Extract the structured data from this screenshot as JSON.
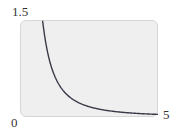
{
  "chart_data": {
    "type": "line",
    "title": "",
    "xlabel": "",
    "ylabel": "",
    "xlim": [
      0,
      5
    ],
    "ylim": [
      0,
      1.5
    ],
    "grid": false,
    "legend": null,
    "tick_labels": {
      "y_max": "1.5",
      "origin": "0",
      "x_max": "5"
    },
    "series": [
      {
        "name": "curve",
        "function": "y = 1/x^2",
        "color": "#3a3a4a",
        "x": [
          0.82,
          0.9,
          1.0,
          1.2,
          1.5,
          2.0,
          2.5,
          3.0,
          3.5,
          4.0,
          4.5,
          5.0
        ],
        "y": [
          1.49,
          1.23,
          1.0,
          0.69,
          0.44,
          0.25,
          0.16,
          0.11,
          0.08,
          0.06,
          0.05,
          0.04
        ]
      }
    ]
  },
  "colors": {
    "plot_bg": "#efefef",
    "curve": "#3a3a4a"
  }
}
